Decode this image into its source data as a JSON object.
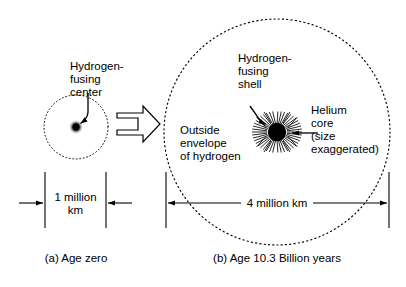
{
  "figure": {
    "type": "scientific-diagram",
    "background_color": "#ffffff",
    "ink_color": "#000000"
  },
  "panel_a": {
    "caption": "(a) Age zero",
    "labels": {
      "core_line1": "Hydrogen-",
      "core_line2": "fusing",
      "core_line3": "center"
    },
    "dimension": {
      "line1": "1 million",
      "line2": "km",
      "value": 1,
      "unit": "million km",
      "arrow_direction": "inward"
    },
    "star": {
      "envelope_style": "dotted-circle",
      "center_cx": 76,
      "center_cy": 127,
      "envelope_radius": 32,
      "core_radius": 4,
      "core_fill": "#000000"
    }
  },
  "transition": {
    "arrow_label": "",
    "arrow_name": "evolution-arrow",
    "direction": "right",
    "style": "outlined-block-arrow"
  },
  "panel_b": {
    "caption": "(b) Age 10.3 Billion years",
    "labels": {
      "shell_line1": "Hydrogen-",
      "shell_line2": "fusing",
      "shell_line3": "shell",
      "envelope_line1": "Outside",
      "envelope_line2": "envelope",
      "envelope_line3": "of hydrogen",
      "core_line1": "Helium",
      "core_line2": "core",
      "core_line3": "(size",
      "core_line4": "exaggerated)"
    },
    "dimension": {
      "text": "4 million km",
      "value": 4,
      "unit": "million km",
      "arrow_direction": "outward"
    },
    "star": {
      "envelope_style": "dotted-circle",
      "center_cx": 277,
      "center_cy": 132,
      "envelope_radius": 113,
      "core_radius": 9,
      "core_fill": "#000000",
      "shell_rays": 56,
      "shell_inner_radius": 10,
      "shell_outer_radius": 25
    }
  }
}
